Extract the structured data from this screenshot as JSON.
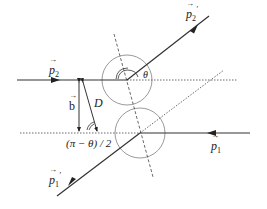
{
  "diagram": {
    "colors": {
      "line": "#333333",
      "circle": "#9a9a9a",
      "background": "#ffffff"
    },
    "labels": {
      "p2_in": {
        "sym": "p",
        "sub": "2",
        "prime": ""
      },
      "p2_out": {
        "sym": "p",
        "sub": "2",
        "prime": "′"
      },
      "p1_in": {
        "sym": "p",
        "sub": "1",
        "prime": ""
      },
      "p1_out": {
        "sym": "p",
        "sub": "1",
        "prime": "′"
      },
      "b": "b",
      "D": "D",
      "theta": "θ",
      "half_angle": "(π − θ) / 2"
    },
    "elements": [
      "incoming particle 2 trajectory (left, arrow right)",
      "outgoing particle 2 trajectory (upper right)",
      "incoming particle 1 trajectory (right, arrow left)",
      "outgoing particle 1 trajectory (lower left)",
      "two circles of the spheres at contact",
      "dashed line of centers",
      "impact parameter b and separation D",
      "scattering angle θ"
    ]
  }
}
